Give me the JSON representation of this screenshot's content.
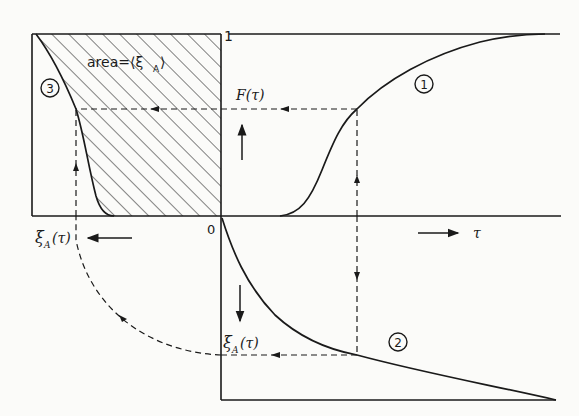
{
  "diagram": {
    "type": "graphical construction of interfacial area from residence time distribution",
    "labels": {
      "one": "1",
      "zero": "0",
      "area": "area=⟨ξ",
      "area_sub": "A",
      "area_close": "⟩",
      "F_tau": "F(τ)",
      "xi_sym": "ξ",
      "xi_sub": "A",
      "tau_arg": "(τ)",
      "tau": "τ"
    },
    "curves": [
      {
        "id": "1",
        "marker": "1",
        "description": "F(τ) cumulative distribution, S-shaped rising from 0 to 1"
      },
      {
        "id": "2",
        "marker": "2",
        "description": "ξ_A(τ), decaying curve below the τ axis"
      },
      {
        "id": "3",
        "marker": "3",
        "description": "ξ_A versus F, hatched area equals ⟨ξ_A⟩"
      }
    ],
    "arrows": [
      "right arrow toward τ",
      "up arrow toward F(τ)",
      "down arrow toward ξ_A(τ)",
      "left arrow toward ξ_A(τ)"
    ],
    "colors": {
      "ink": "#1a1a1a",
      "paper": "#fbfbf9"
    }
  }
}
